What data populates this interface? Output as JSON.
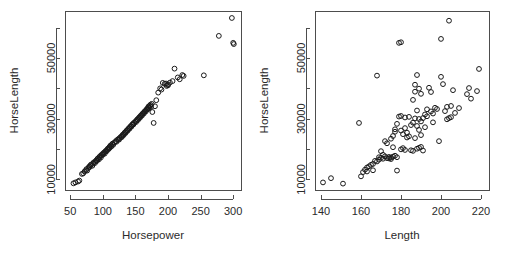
{
  "figure": {
    "width": 506,
    "height": 263,
    "background": "#ffffff",
    "point_symbol": "open-circle",
    "point_stroke": "#1a1a1a",
    "axis_color": "#4d4d4d",
    "text_color": "#2b2b2b",
    "panel_count": 2
  },
  "chart_data": [
    {
      "type": "scatter",
      "title": "",
      "xlabel": "Horsepower",
      "ylabel": "HorseLength",
      "xlim": [
        42,
        312
      ],
      "ylim": [
        6500,
        65500
      ],
      "grid": false,
      "legend": null,
      "xticks": [
        50,
        100,
        150,
        200,
        250,
        300
      ],
      "xtick_labels": [
        "50",
        "100",
        "150",
        "200",
        "250",
        "300"
      ],
      "yticks": [
        10000,
        20000,
        30000,
        40000,
        50000,
        60000
      ],
      "ytick_labels": [
        "10000",
        "",
        "30000",
        "",
        "50000",
        ""
      ],
      "points": [
        [
          55,
          8700
        ],
        [
          58,
          9000
        ],
        [
          62,
          9300
        ],
        [
          64,
          9600
        ],
        [
          68,
          11800
        ],
        [
          70,
          12000
        ],
        [
          72,
          12600
        ],
        [
          74,
          13000
        ],
        [
          75,
          13400
        ],
        [
          76,
          12900
        ],
        [
          78,
          13800
        ],
        [
          79,
          14200
        ],
        [
          80,
          14100
        ],
        [
          81,
          14600
        ],
        [
          82,
          14900
        ],
        [
          84,
          14500
        ],
        [
          85,
          15200
        ],
        [
          86,
          15600
        ],
        [
          88,
          15400
        ],
        [
          89,
          16000
        ],
        [
          90,
          16300
        ],
        [
          91,
          16100
        ],
        [
          92,
          16800
        ],
        [
          93,
          17000
        ],
        [
          94,
          16600
        ],
        [
          95,
          17400
        ],
        [
          96,
          17700
        ],
        [
          97,
          17200
        ],
        [
          98,
          18000
        ],
        [
          99,
          18300
        ],
        [
          100,
          18100
        ],
        [
          101,
          18600
        ],
        [
          102,
          18900
        ],
        [
          103,
          18500
        ],
        [
          104,
          19200
        ],
        [
          105,
          19500
        ],
        [
          106,
          19300
        ],
        [
          107,
          19900
        ],
        [
          108,
          20200
        ],
        [
          109,
          20000
        ],
        [
          110,
          20600
        ],
        [
          110,
          20300
        ],
        [
          111,
          20900
        ],
        [
          112,
          21200
        ],
        [
          113,
          20800
        ],
        [
          114,
          21500
        ],
        [
          115,
          21800
        ],
        [
          116,
          21400
        ],
        [
          118,
          22200
        ],
        [
          120,
          22600
        ],
        [
          121,
          22400
        ],
        [
          122,
          23000
        ],
        [
          124,
          23300
        ],
        [
          125,
          23100
        ],
        [
          126,
          23700
        ],
        [
          128,
          24100
        ],
        [
          129,
          23900
        ],
        [
          130,
          24500
        ],
        [
          131,
          24800
        ],
        [
          132,
          24600
        ],
        [
          133,
          25200
        ],
        [
          134,
          25500
        ],
        [
          135,
          25300
        ],
        [
          136,
          25900
        ],
        [
          137,
          26200
        ],
        [
          138,
          26000
        ],
        [
          139,
          26600
        ],
        [
          140,
          26900
        ],
        [
          141,
          26700
        ],
        [
          142,
          27300
        ],
        [
          143,
          27600
        ],
        [
          144,
          27400
        ],
        [
          145,
          28000
        ],
        [
          146,
          28300
        ],
        [
          147,
          28100
        ],
        [
          148,
          28700
        ],
        [
          150,
          29100
        ],
        [
          151,
          28900
        ],
        [
          152,
          29500
        ],
        [
          153,
          29800
        ],
        [
          154,
          29600
        ],
        [
          155,
          30200
        ],
        [
          156,
          30500
        ],
        [
          157,
          30300
        ],
        [
          158,
          30900
        ],
        [
          159,
          31200
        ],
        [
          160,
          31000
        ],
        [
          161,
          31600
        ],
        [
          162,
          31900
        ],
        [
          163,
          31700
        ],
        [
          164,
          32300
        ],
        [
          165,
          32600
        ],
        [
          166,
          32400
        ],
        [
          167,
          33000
        ],
        [
          168,
          33300
        ],
        [
          169,
          33100
        ],
        [
          170,
          33700
        ],
        [
          170,
          34000
        ],
        [
          171,
          33500
        ],
        [
          172,
          34300
        ],
        [
          173,
          34600
        ],
        [
          174,
          33900
        ],
        [
          175,
          34900
        ],
        [
          176,
          32200
        ],
        [
          178,
          28600
        ],
        [
          180,
          34100
        ],
        [
          182,
          36100
        ],
        [
          185,
          38600
        ],
        [
          188,
          40000
        ],
        [
          190,
          39600
        ],
        [
          192,
          41800
        ],
        [
          195,
          41500
        ],
        [
          197,
          41600
        ],
        [
          198,
          40800
        ],
        [
          200,
          41000
        ],
        [
          200,
          41300
        ],
        [
          203,
          41900
        ],
        [
          207,
          42400
        ],
        [
          210,
          46500
        ],
        [
          215,
          43600
        ],
        [
          218,
          43000
        ],
        [
          222,
          44400
        ],
        [
          224,
          44100
        ],
        [
          255,
          44300
        ],
        [
          278,
          57300
        ],
        [
          298,
          63200
        ],
        [
          300,
          55000
        ],
        [
          301,
          54600
        ]
      ]
    },
    {
      "type": "scatter",
      "title": "",
      "xlabel": "Length",
      "ylabel": "HorseLength",
      "xlim": [
        137,
        224
      ],
      "ylim": [
        6500,
        65500
      ],
      "grid": false,
      "legend": null,
      "xticks": [
        140,
        160,
        180,
        200,
        220
      ],
      "xtick_labels": [
        "140",
        "160",
        "180",
        "200",
        "220"
      ],
      "yticks": [
        10000,
        20000,
        30000,
        40000,
        50000,
        60000
      ],
      "ytick_labels": [
        "10000",
        "",
        "30000",
        "",
        "50000",
        ""
      ],
      "points": [
        [
          141,
          9000
        ],
        [
          145,
          10400
        ],
        [
          151,
          8600
        ],
        [
          159,
          28600
        ],
        [
          160,
          11000
        ],
        [
          161,
          12400
        ],
        [
          162,
          13200
        ],
        [
          163,
          13900
        ],
        [
          163,
          12600
        ],
        [
          164,
          14300
        ],
        [
          165,
          14800
        ],
        [
          166,
          15100
        ],
        [
          166,
          13000
        ],
        [
          167,
          16100
        ],
        [
          168,
          44200
        ],
        [
          168,
          15900
        ],
        [
          169,
          17300
        ],
        [
          169,
          16500
        ],
        [
          170,
          19300
        ],
        [
          170,
          17100
        ],
        [
          171,
          18100
        ],
        [
          171,
          16800
        ],
        [
          172,
          17600
        ],
        [
          172,
          22600
        ],
        [
          173,
          17000
        ],
        [
          173,
          21900
        ],
        [
          174,
          17400
        ],
        [
          174,
          16900
        ],
        [
          175,
          17200
        ],
        [
          175,
          23400
        ],
        [
          175,
          16700
        ],
        [
          176,
          17500
        ],
        [
          176,
          24300
        ],
        [
          176,
          20600
        ],
        [
          177,
          17800
        ],
        [
          177,
          25700
        ],
        [
          177,
          26500
        ],
        [
          178,
          17300
        ],
        [
          178,
          12900
        ],
        [
          178,
          28300
        ],
        [
          179,
          30700
        ],
        [
          179,
          55000
        ],
        [
          180,
          55200
        ],
        [
          180,
          30900
        ],
        [
          180,
          19900
        ],
        [
          180,
          26100
        ],
        [
          181,
          24900
        ],
        [
          181,
          20300
        ],
        [
          182,
          30400
        ],
        [
          182,
          26900
        ],
        [
          182,
          19700
        ],
        [
          183,
          23800
        ],
        [
          183,
          25400
        ],
        [
          184,
          30600
        ],
        [
          184,
          24200
        ],
        [
          185,
          19600
        ],
        [
          185,
          27900
        ],
        [
          186,
          36200
        ],
        [
          186,
          19400
        ],
        [
          186,
          28700
        ],
        [
          187,
          41200
        ],
        [
          187,
          30100
        ],
        [
          187,
          38900
        ],
        [
          187,
          23600
        ],
        [
          188,
          44400
        ],
        [
          188,
          32700
        ],
        [
          188,
          27600
        ],
        [
          188,
          20100
        ],
        [
          189,
          39900
        ],
        [
          189,
          29900
        ],
        [
          189,
          20400
        ],
        [
          189,
          26300
        ],
        [
          190,
          29100
        ],
        [
          190,
          38200
        ],
        [
          190,
          20700
        ],
        [
          190,
          24600
        ],
        [
          191,
          30200
        ],
        [
          191,
          19500
        ],
        [
          192,
          31400
        ],
        [
          192,
          27200
        ],
        [
          193,
          33100
        ],
        [
          193,
          30800
        ],
        [
          194,
          40200
        ],
        [
          195,
          32400
        ],
        [
          195,
          38800
        ],
        [
          196,
          31700
        ],
        [
          196,
          28800
        ],
        [
          197,
          33600
        ],
        [
          198,
          33200
        ],
        [
          199,
          22600
        ],
        [
          200,
          56300
        ],
        [
          200,
          43800
        ],
        [
          201,
          41400
        ],
        [
          202,
          32500
        ],
        [
          203,
          29800
        ],
        [
          203,
          33900
        ],
        [
          204,
          62300
        ],
        [
          204,
          30200
        ],
        [
          205,
          34200
        ],
        [
          205,
          30500
        ],
        [
          206,
          39400
        ],
        [
          207,
          31900
        ],
        [
          209,
          33500
        ],
        [
          213,
          38100
        ],
        [
          214,
          40100
        ],
        [
          215,
          36600
        ],
        [
          218,
          39100
        ],
        [
          219,
          46400
        ]
      ]
    }
  ]
}
